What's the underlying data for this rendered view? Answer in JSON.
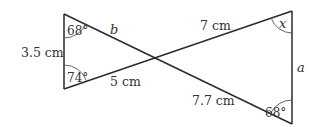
{
  "diagram": {
    "title": "",
    "type": "two triangles (bowtie) sharing a vertex at intersecting lines",
    "left_triangle": {
      "side_vertical": "3.5 cm",
      "side_bottom": "5 cm",
      "side_top": "b",
      "angle_top": "68°",
      "angle_bottom": "74°"
    },
    "right_triangle": {
      "side_top": "7 cm",
      "side_bottom": "7.7 cm",
      "side_vertical": "a",
      "angle_top": "x",
      "angle_bottom": "68°"
    }
  }
}
